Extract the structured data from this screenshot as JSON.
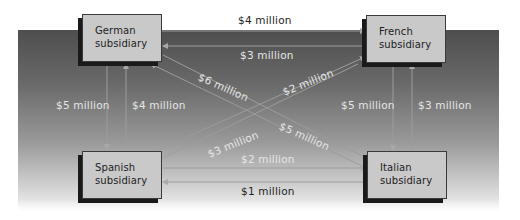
{
  "diagram": {
    "type": "intercompany-flow",
    "colors": {
      "panel_top": "#4e4e4e",
      "panel_bottom": "#f4f4f4",
      "box_fill": "#c9c9c9",
      "box_shadow": "#1a1a1a",
      "line": "#9c9c9c",
      "label_light": "#e6e6e6",
      "label_dark": "#1e1e1e"
    },
    "nodes": {
      "german": {
        "label": "German\nsubsidiary"
      },
      "french": {
        "label": "French\nsubsidiary"
      },
      "spanish": {
        "label": "Spanish\nsubsidiary"
      },
      "italian": {
        "label": "Italian\nsubsidiary"
      }
    },
    "flows": [
      {
        "id": "german_to_french",
        "from": "German",
        "to": "French",
        "amount": "$4 million"
      },
      {
        "id": "french_to_german",
        "from": "French",
        "to": "German",
        "amount": "$3 million"
      },
      {
        "id": "german_to_italian",
        "from": "German",
        "to": "Italian",
        "amount": "$6 million"
      },
      {
        "id": "spanish_to_french",
        "from": "Spanish",
        "to": "French",
        "amount": "$2 million"
      },
      {
        "id": "german_to_spanish",
        "from": "German",
        "to": "Spanish",
        "amount": "$5 million"
      },
      {
        "id": "spanish_to_german",
        "from": "Spanish",
        "to": "German",
        "amount": "$4 million"
      },
      {
        "id": "french_to_italian",
        "from": "French",
        "to": "Italian",
        "amount": "$5 million"
      },
      {
        "id": "italian_to_french",
        "from": "Italian",
        "to": "French",
        "amount": "$3 million"
      },
      {
        "id": "french_to_spanish",
        "from": "French",
        "to": "Spanish",
        "amount": "$3 million"
      },
      {
        "id": "italian_to_german",
        "from": "Italian",
        "to": "German",
        "amount": "$5 million"
      },
      {
        "id": "spanish_to_italian",
        "from": "Spanish",
        "to": "Italian",
        "amount": "$2 million"
      },
      {
        "id": "italian_to_spanish",
        "from": "Italian",
        "to": "Spanish",
        "amount": "$1 million"
      }
    ]
  }
}
